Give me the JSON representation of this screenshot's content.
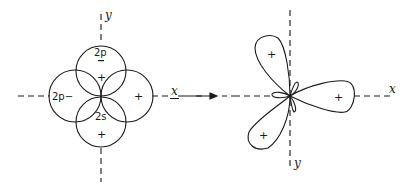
{
  "figure": {
    "arrow": "right-arrow",
    "left_diagram": {
      "axes": {
        "x_label": "x",
        "y_label": "y"
      },
      "orbitals": [
        {
          "name": "2p",
          "position": "top",
          "sign_label": "2p",
          "sign": "−"
        },
        {
          "name": "2p",
          "position": "left",
          "sign_label": "2p",
          "sign": "−"
        },
        {
          "name": "2s",
          "position": "bottom",
          "sign_label": "2s"
        }
      ],
      "signs": {
        "top_inner": "+",
        "right": "+",
        "bottom": "+"
      },
      "labels": {
        "top": "2p",
        "top_minus": "−",
        "left": "2p−",
        "center_bottom": "2s"
      }
    },
    "right_diagram": {
      "axes": {
        "x_label": "x",
        "y_label": "y"
      },
      "lobes": [
        {
          "direction": "right",
          "sign": "+"
        },
        {
          "direction": "upper-left",
          "sign": "+"
        },
        {
          "direction": "lower-left",
          "sign": "+"
        }
      ],
      "signs": {
        "right": "+",
        "upper_left": "+",
        "lower_left": "+"
      }
    }
  }
}
